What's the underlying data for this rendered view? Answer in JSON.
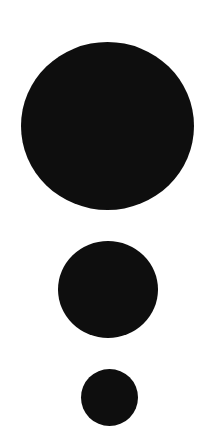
{
  "canvas": {
    "width": 212,
    "height": 443,
    "background": "#ffffff"
  },
  "shapes": [
    {
      "name": "large-circle",
      "shape": "circle",
      "color": "#0e0e0e",
      "cx": 107,
      "cy": 126,
      "diameter": 170
    },
    {
      "name": "medium-circle",
      "shape": "circle",
      "color": "#0e0e0e",
      "cx": 108,
      "cy": 290,
      "diameter": 98
    },
    {
      "name": "small-circle",
      "shape": "circle",
      "color": "#0e0e0e",
      "cx": 109,
      "cy": 397,
      "diameter": 57
    }
  ]
}
